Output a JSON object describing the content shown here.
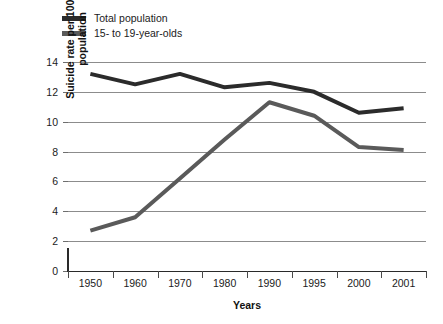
{
  "legend": {
    "items": [
      {
        "label": "Total population",
        "color": "#2b2b2b",
        "key": "total_population"
      },
      {
        "label": "15- to 19-year-olds",
        "color": "#5a5a5a",
        "key": "teens_15_19"
      }
    ]
  },
  "axes": {
    "y_title_line1": "Suicide rate per 100,000",
    "y_title_line2": "population",
    "x_title": "Years",
    "y_ticks": [
      "0",
      "2",
      "4",
      "6",
      "8",
      "10",
      "12",
      "14"
    ],
    "x_ticks": [
      "1950",
      "1960",
      "1970",
      "1980",
      "1990",
      "1995",
      "2000",
      "2001"
    ]
  },
  "chart_data": {
    "type": "line",
    "title": "",
    "xlabel": "Years",
    "ylabel": "Suicide rate per 100,000 population",
    "categories": [
      "1950",
      "1960",
      "1970",
      "1980",
      "1990",
      "1995",
      "2000",
      "2001"
    ],
    "series": [
      {
        "name": "Total population",
        "color": "#2b2b2b",
        "values": [
          13.2,
          12.5,
          13.2,
          12.3,
          12.6,
          12.0,
          10.6,
          10.9
        ]
      },
      {
        "name": "15- to 19-year-olds",
        "color": "#5a5a5a",
        "values": [
          2.7,
          3.6,
          6.2,
          8.8,
          11.3,
          10.4,
          8.3,
          8.1
        ]
      }
    ],
    "ylim": [
      0,
      14.4
    ],
    "ytick_values": [
      0,
      2,
      4,
      6,
      8,
      10,
      12,
      14
    ],
    "grid": "horizontal",
    "legend_position": "top-left",
    "line_width": 4
  },
  "caption": {
    "partial_text": ""
  }
}
